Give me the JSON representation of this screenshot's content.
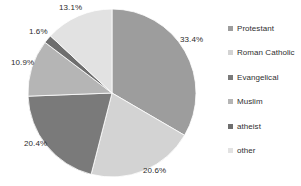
{
  "chart_data": {
    "type": "pie",
    "title": "",
    "subtitle": "",
    "xlabel": "",
    "ylabel": "",
    "legend_position": "right",
    "grid": false,
    "value_unit": "%",
    "start_angle_deg": 0,
    "direction": "clockwise",
    "categories": [
      "Protestant",
      "Roman Catholic",
      "Evangelical",
      "Muslim",
      "atheist",
      "other"
    ],
    "values": [
      33.4,
      20.6,
      20.4,
      10.9,
      1.6,
      13.1
    ],
    "data_labels": [
      "33.4%",
      "20.6%",
      "20.4%",
      "10.9%",
      "1.6%",
      "13.1%"
    ],
    "colors": [
      "#9d9d9d",
      "#d3d3d3",
      "#7a7a7a",
      "#b5b5b5",
      "#6e6e6e",
      "#e2e2e2"
    ],
    "slices": [
      {
        "label": "Protestant",
        "value": 33.4,
        "data_label": "33.4%",
        "color": "#9d9d9d"
      },
      {
        "label": "Roman Catholic",
        "value": 20.6,
        "data_label": "20.6%",
        "color": "#d3d3d3"
      },
      {
        "label": "Evangelical",
        "value": 20.4,
        "data_label": "20.4%",
        "color": "#7a7a7a"
      },
      {
        "label": "Muslim",
        "value": 10.9,
        "data_label": "10.9%",
        "color": "#b5b5b5"
      },
      {
        "label": "atheist",
        "value": 1.6,
        "data_label": "1.6%",
        "color": "#6e6e6e"
      },
      {
        "label": "other",
        "value": 13.1,
        "data_label": "13.1%",
        "color": "#e2e2e2"
      }
    ]
  },
  "legend": {
    "items": [
      {
        "label": "Protestant",
        "color": "#9d9d9d"
      },
      {
        "label": "Roman Catholic",
        "color": "#d3d3d3"
      },
      {
        "label": "Evangelical",
        "color": "#7a7a7a"
      },
      {
        "label": "Muslim",
        "color": "#b5b5b5"
      },
      {
        "label": "atheist",
        "color": "#6e6e6e"
      },
      {
        "label": "other",
        "color": "#e2e2e2"
      }
    ]
  },
  "labels": {
    "protestant_pct": "33.4%",
    "roman_catholic_pct": "20.6%",
    "evangelical_pct": "20.4%",
    "muslim_pct": "10.9%",
    "atheist_pct": "1.6%",
    "other_pct": "13.1%"
  }
}
